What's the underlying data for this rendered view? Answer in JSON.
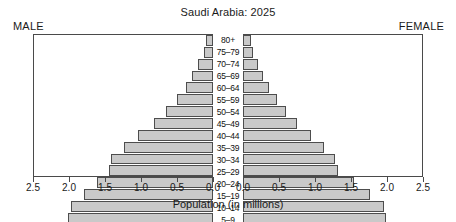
{
  "chart_data": {
    "type": "bar",
    "subtype": "population-pyramid",
    "title": "Saudi Arabia: 2025",
    "xlabel": "Population (in millions)",
    "ylabel": "",
    "grid": false,
    "legend_position": "none",
    "left_caption": "MALE",
    "right_caption": "FEMALE",
    "categories": [
      "80+",
      "75–79",
      "70–74",
      "65–69",
      "60–64",
      "55–59",
      "50–54",
      "45–49",
      "40–44",
      "35–39",
      "30–34",
      "25–29",
      "20–24",
      "15–19",
      "10–14",
      "5–9",
      "0–4"
    ],
    "series": [
      {
        "name": "MALE",
        "side": "left",
        "values": [
          0.1,
          0.13,
          0.21,
          0.29,
          0.38,
          0.5,
          0.65,
          0.83,
          1.05,
          1.25,
          1.43,
          1.45,
          1.62,
          1.8,
          1.98,
          2.02,
          2.0
        ]
      },
      {
        "name": "FEMALE",
        "side": "right",
        "values": [
          0.11,
          0.14,
          0.21,
          0.28,
          0.36,
          0.47,
          0.6,
          0.76,
          0.95,
          1.13,
          1.28,
          1.33,
          1.55,
          1.78,
          1.97,
          2.0,
          1.95
        ]
      }
    ],
    "xlim": [
      0,
      2.5
    ],
    "left_axis_ticks": [
      "2.5",
      "2.0",
      "1.5",
      "1.0",
      "0.5",
      "0.0"
    ],
    "left_axis_tick_values": [
      2.5,
      2.0,
      1.5,
      1.0,
      0.5,
      0.0
    ],
    "right_axis_ticks": [
      "0.0",
      "0.5",
      "1.0",
      "1.5",
      "2.0",
      "2.5"
    ],
    "right_axis_tick_values": [
      0.0,
      0.5,
      1.0,
      1.5,
      2.0,
      2.5
    ],
    "bar_fill_color": "#c9c9c9",
    "bar_border_color": "#4d4d4d",
    "frame_color": "#4a4a4a"
  }
}
